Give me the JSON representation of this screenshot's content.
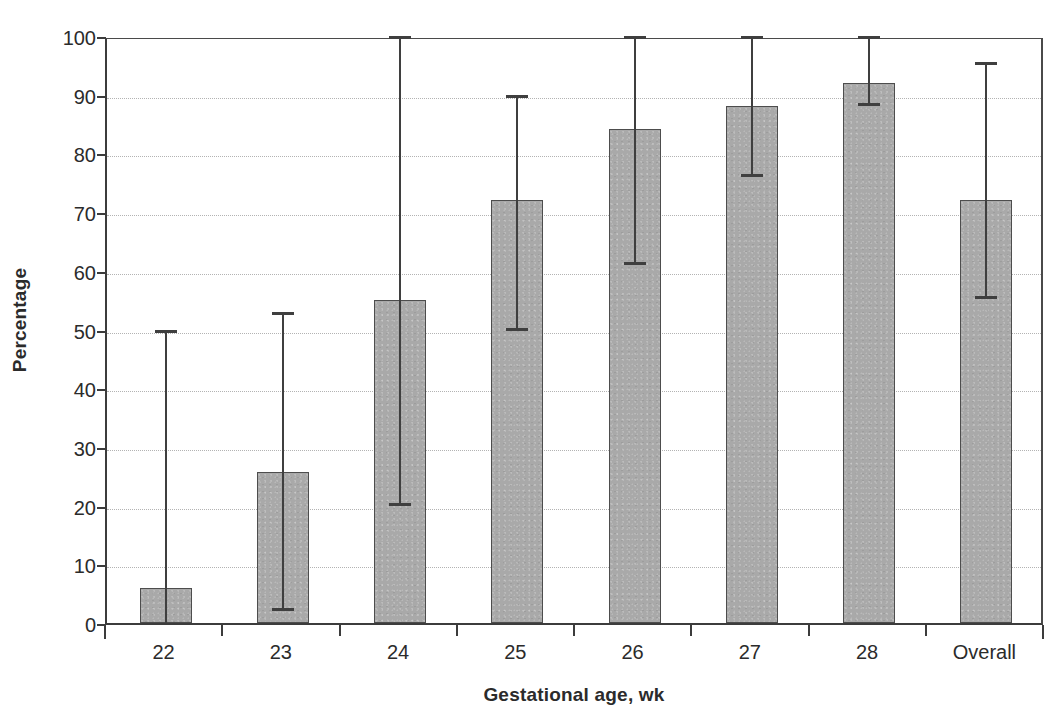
{
  "chart_data": {
    "type": "bar",
    "title": "",
    "xlabel": "Gestational age, wk",
    "ylabel": "Percentage",
    "categories": [
      "22",
      "23",
      "24",
      "25",
      "26",
      "27",
      "28",
      "Overall"
    ],
    "values": [
      6,
      25.8,
      55,
      72,
      84.2,
      88,
      92,
      72
    ],
    "error_low": [
      0,
      2,
      20,
      49.8,
      61,
      76,
      88,
      55.2
    ],
    "error_high": [
      50,
      53,
      100,
      90,
      100,
      100,
      100,
      95.5
    ],
    "ylim": [
      0,
      100
    ],
    "yticks": [
      0,
      10,
      20,
      30,
      40,
      50,
      60,
      70,
      80,
      90,
      100
    ],
    "ytick_labels": [
      "0",
      "10",
      "20",
      "30",
      "40",
      "50",
      "60",
      "70",
      "80",
      "90",
      "100"
    ],
    "grid": "horizontal",
    "legend": "none",
    "bar_color": "#a9a9a9",
    "bar_edge_color": "#4d4d4d",
    "errorbar_color": "#3f3f3f",
    "axis_color": "#3c3c3c",
    "gridline_color": "#b3b3b3",
    "background_color": "#ffffff"
  }
}
